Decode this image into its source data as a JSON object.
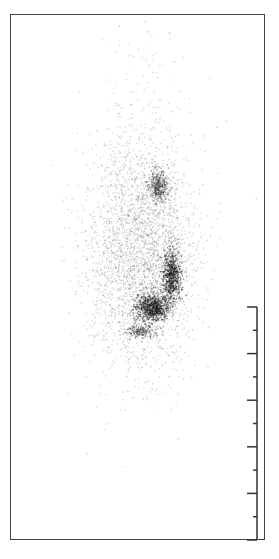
{
  "figure": {
    "frame": {
      "left": 10,
      "top": 14,
      "right": 265,
      "bottom": 540,
      "color": "#444444"
    },
    "scale_bar": {
      "x": 257,
      "top": 307,
      "bottom": 540,
      "major_ticks": 6,
      "minor_ticks": 5,
      "major_length": 10,
      "minor_length": 4,
      "color": "#333333"
    },
    "blobs": [
      {
        "name": "upper-knot",
        "cx": 157,
        "cy": 186,
        "rx": 9,
        "ry": 14,
        "density": 0.6
      },
      {
        "name": "arc-right",
        "cx": 171,
        "cy": 275,
        "rx": 8,
        "ry": 22,
        "density": 0.85
      },
      {
        "name": "arc-bottom",
        "cx": 152,
        "cy": 307,
        "rx": 14,
        "ry": 12,
        "density": 0.95
      },
      {
        "name": "lower-tail",
        "cx": 140,
        "cy": 331,
        "rx": 12,
        "ry": 5,
        "density": 0.6
      },
      {
        "name": "diffuse-halo",
        "cx": 140,
        "cy": 250,
        "rx": 45,
        "ry": 95,
        "density": 0.12
      }
    ]
  }
}
